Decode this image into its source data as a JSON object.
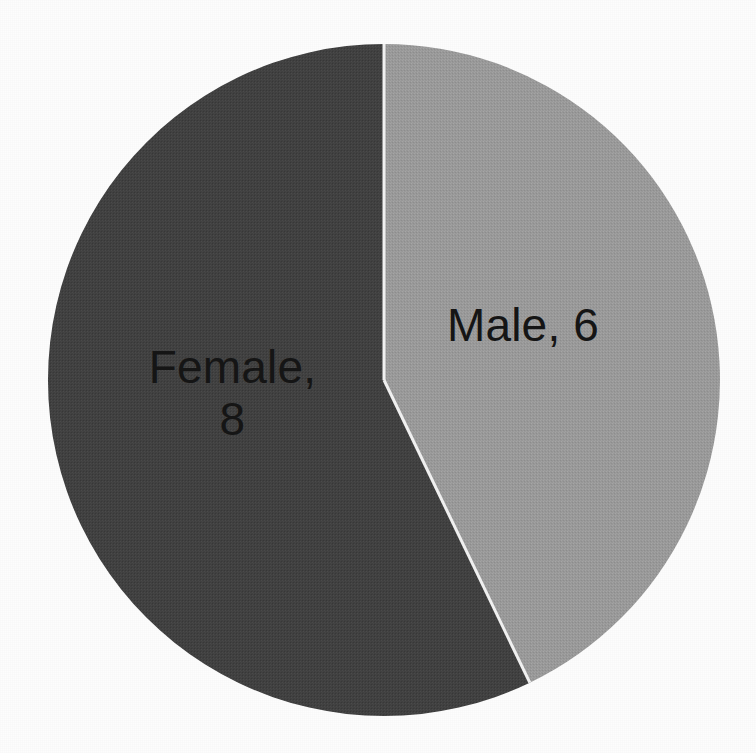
{
  "figure": {
    "background_color": "#fdfdfd",
    "kind": "pie-chart-image",
    "title": "",
    "width": 756,
    "height": 753
  },
  "pie": {
    "center_x": 384,
    "center_y": 380,
    "radius": 336,
    "start_angle_deg": 0,
    "divider_color": "#f2f2f2",
    "divider_width": 3
  },
  "labels": {
    "male": "Male, 6",
    "female": "Female,\n8"
  },
  "chart_data": {
    "type": "pie",
    "title": "",
    "subtitle": "",
    "xlabel": "",
    "ylabel": "",
    "legend": false,
    "legend_position": "none",
    "grid": false,
    "total": 14,
    "categories": [
      "Male",
      "Female"
    ],
    "values": [
      6,
      8
    ],
    "value_labels": [
      "Male, 6",
      "Female, 8"
    ],
    "percentages": [
      42.9,
      57.1
    ],
    "slice_angles_deg": [
      154.3,
      205.7
    ],
    "colors": [
      "#9a9a9a",
      "#414141"
    ],
    "slices": [
      {
        "name": "Male",
        "value": 6,
        "label": "Male, 6",
        "percent": 42.9,
        "color": "#9a9a9a",
        "start_angle_deg": 0,
        "end_angle_deg": 154.3,
        "label_x": 523,
        "label_y": 345
      },
      {
        "name": "Female",
        "value": 8,
        "label": "Female, 8",
        "percent": 57.1,
        "color": "#414141",
        "start_angle_deg": 154.3,
        "end_angle_deg": 360,
        "label_x": 232,
        "label_y": 395
      }
    ]
  }
}
